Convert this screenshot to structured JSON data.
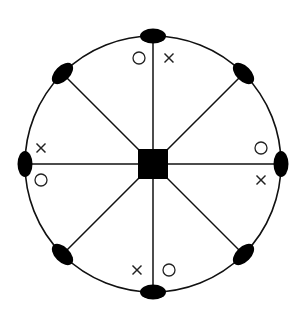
{
  "diagram": {
    "type": "radial-hub-and-spoke",
    "center": {
      "x": 153,
      "y": 164
    },
    "radius": 128,
    "hub": {
      "shape": "square",
      "size": 30,
      "color": "#000000"
    },
    "spoke_count": 8,
    "node_shape": "filled-ellipse",
    "line_color": "#111111",
    "nodes": [
      {
        "angle": 0,
        "markers": [
          {
            "type": "circle",
            "dx": -14,
            "dy": 22
          },
          {
            "type": "cross",
            "dx": 16,
            "dy": 22
          }
        ]
      },
      {
        "angle": 45,
        "markers": []
      },
      {
        "angle": 90,
        "markers": [
          {
            "type": "circle",
            "dx": -20,
            "dy": -16
          },
          {
            "type": "cross",
            "dx": -20,
            "dy": 16
          }
        ]
      },
      {
        "angle": 135,
        "markers": []
      },
      {
        "angle": 180,
        "markers": [
          {
            "type": "cross",
            "dx": -16,
            "dy": -22
          },
          {
            "type": "circle",
            "dx": 16,
            "dy": -22
          }
        ]
      },
      {
        "angle": 225,
        "markers": []
      },
      {
        "angle": 270,
        "markers": [
          {
            "type": "cross",
            "dx": 16,
            "dy": -16
          },
          {
            "type": "circle",
            "dx": 16,
            "dy": 16
          }
        ]
      },
      {
        "angle": 315,
        "markers": []
      }
    ],
    "legend": {
      "circle_symbol": "○",
      "cross_symbol": "×"
    }
  }
}
